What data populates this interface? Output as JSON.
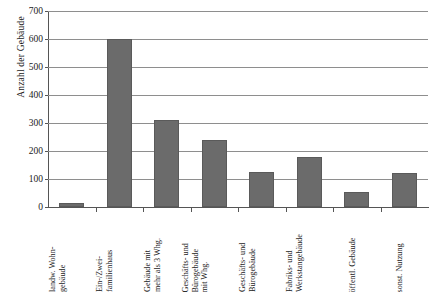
{
  "chart_data": {
    "type": "bar",
    "title": "",
    "xlabel": "",
    "ylabel": "Anzahl der Gebäude",
    "ylim": [
      0,
      700
    ],
    "yticks": [
      0,
      100,
      200,
      300,
      400,
      500,
      600,
      700
    ],
    "grid": true,
    "legend": null,
    "bar_color": "#6b6b6b",
    "categories": [
      "landw. Wohn-gebäude",
      "Ein-/Zwei-familienhaus",
      "Gebäude mit mehr als 3 Whg.",
      "Geschäfts- und Bürogebäude mit Whg.",
      "Geschäfts- und Bürogebäude",
      "Fabriks- und Werkstangebäude",
      "öffentl. Gebäude",
      "sonst. Nutzung"
    ],
    "category_lines": [
      [
        "landw. Wohn-",
        "gebäude"
      ],
      [
        "Ein-/Zwei-",
        "familienhaus"
      ],
      [
        "Gebäude mit",
        "mehr als 3 Whg."
      ],
      [
        "Geschäfts- und",
        "Bürogebäude",
        "mit Whg."
      ],
      [
        "Geschäfts- und",
        "Bürogebäude"
      ],
      [
        "Fabriks- und",
        "Werkstangebäude"
      ],
      [
        "öffentl. Gebäude"
      ],
      [
        "sonst. Nutzung"
      ]
    ],
    "values": [
      15,
      600,
      312,
      240,
      125,
      177,
      52,
      123
    ]
  }
}
